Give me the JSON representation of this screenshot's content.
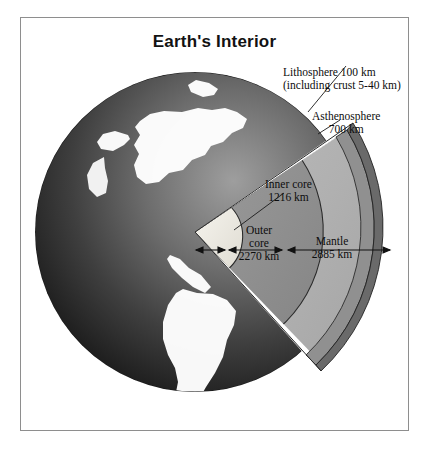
{
  "figure": {
    "title": "Earth's Interior",
    "frame_color": "#8e8e8e",
    "background": "#ffffff"
  },
  "labels": {
    "lithosphere": {
      "line1": "Lithosphere 100 km",
      "line2": "(including crust 5-40 km)"
    },
    "asthenosphere": {
      "line1": "Asthenosphere",
      "line2": "700 km"
    },
    "inner_core": {
      "line1": "Inner core",
      "line2": "1216 km"
    },
    "outer_core": {
      "line1": "Outer",
      "line2": "core",
      "line3": "2270 km"
    },
    "mantle": {
      "line1": "Mantle",
      "line2": "2885 km"
    }
  },
  "layers": [
    {
      "name": "lithosphere",
      "thickness_km": 100,
      "note": "including crust 5-40 km",
      "color": "#6f6f6f"
    },
    {
      "name": "asthenosphere",
      "thickness_km": 700,
      "color": "#8c8c8c"
    },
    {
      "name": "mantle",
      "thickness_km": 2885,
      "color": "#b0b0b0"
    },
    {
      "name": "outer_core",
      "thickness_km": 2270,
      "color": "#8f8f8f"
    },
    {
      "name": "inner_core",
      "thickness_km": 1216,
      "color": "#eceae2"
    }
  ],
  "globe": {
    "ocean_color": "#2a2a2a",
    "land_color": "#ffffff",
    "outline_color": "#1a1a1a"
  }
}
